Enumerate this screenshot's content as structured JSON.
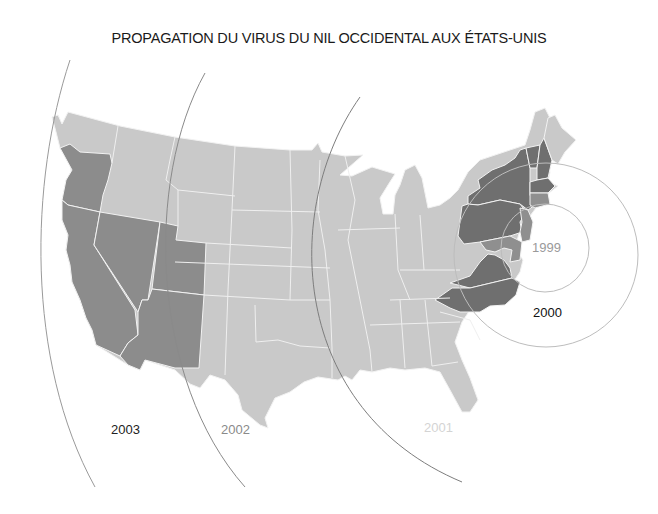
{
  "title": "PROPAGATION DU VIRUS DU NIL OCCIDENTAL AUX ÉTATS-UNIS",
  "colors": {
    "background": "#ffffff",
    "unaffected_state": "#c9c9c9",
    "state_border": "#f2f2f2",
    "wave_2003_states": "#8c8c8c",
    "wave_1999_2000_states": "#6f6f6f",
    "wave_1999_2000_light_states": "#9a9a9a",
    "arc_line": "#8a8a8a",
    "circle_line": "#bdbdbd"
  },
  "labels": {
    "y1999": {
      "text": "1999",
      "color": "#9a9a9a"
    },
    "y2000": {
      "text": "2000",
      "color": "#111111"
    },
    "y2001": {
      "text": "2001",
      "color": "#d4d4d4"
    },
    "y2002": {
      "text": "2002",
      "color": "#8a8a8a"
    },
    "y2003": {
      "text": "2003",
      "color": "#222222"
    }
  },
  "spread_waves": [
    {
      "year": "1999",
      "shape": "circle",
      "region": "New York City area"
    },
    {
      "year": "2000",
      "shape": "circle",
      "region": "Northeast / Mid-Atlantic"
    },
    {
      "year": "2001",
      "shape": "arc",
      "region": "Eastern half"
    },
    {
      "year": "2002",
      "shape": "arc",
      "region": "Central states"
    },
    {
      "year": "2003",
      "shape": "arc",
      "region": "West"
    }
  ],
  "highlighted_states": {
    "wave_2003": [
      "Oregon",
      "California",
      "Nevada",
      "Utah",
      "Arizona"
    ],
    "wave_2000": [
      "New York",
      "Pennsylvania",
      "Vermont",
      "New Hampshire",
      "Massachusetts",
      "Connecticut",
      "Rhode Island",
      "New Jersey",
      "Maryland",
      "Delaware",
      "Virginia",
      "North Carolina"
    ]
  }
}
